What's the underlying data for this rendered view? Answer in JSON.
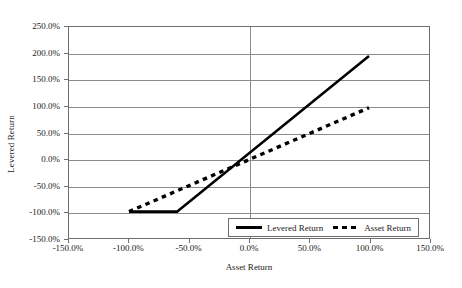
{
  "chart_data": {
    "type": "line",
    "title": "",
    "xlabel": "Asset Return",
    "ylabel": "Levered Return",
    "xlim": [
      -150,
      150
    ],
    "ylim": [
      -150,
      250
    ],
    "grid": true,
    "legend_position": "bottom-right-inside",
    "x_tick_labels": [
      "-150.0%",
      "-100.0%",
      "-50.0%",
      "0.0%",
      "50.0%",
      "100.0%",
      "150.0%"
    ],
    "x_ticks": [
      -150,
      -100,
      -50,
      0,
      50,
      100,
      150
    ],
    "y_tick_labels": [
      "250.0%",
      "200.0%",
      "150.0%",
      "100.0%",
      "50.0%",
      "0.0%",
      "-50.0%",
      "-100.0%",
      "-150.0%"
    ],
    "y_ticks": [
      250,
      200,
      150,
      100,
      50,
      0,
      -50,
      -100,
      -150
    ],
    "series": [
      {
        "name": "Levered Return",
        "style": "solid",
        "color": "#000000",
        "x": [
          -100,
          -60,
          100
        ],
        "values": [
          -100,
          -100,
          195
        ]
      },
      {
        "name": "Asset Return",
        "style": "dashed",
        "color": "#000000",
        "x": [
          -100,
          100
        ],
        "values": [
          -100,
          97
        ]
      }
    ]
  },
  "legend": {
    "entries": [
      {
        "label": "Levered Return"
      },
      {
        "label": "Asset Return"
      }
    ]
  }
}
